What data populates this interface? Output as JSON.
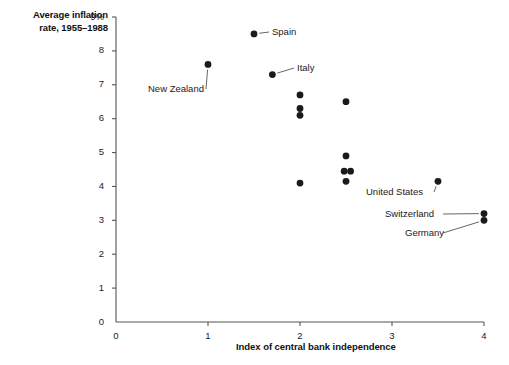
{
  "chart_data": {
    "type": "scatter",
    "title": "",
    "xlabel": "Index of central bank independence",
    "ylabel": "Average inflation rate, 1955–1988",
    "ylabel_lines": [
      "Average inflation",
      "rate, 1955–1988"
    ],
    "xlim": [
      0,
      4
    ],
    "ylim": [
      0,
      9
    ],
    "xticks": [
      0,
      1,
      2,
      3,
      4
    ],
    "xtick_labels": [
      "0",
      "1",
      "2",
      "3",
      "4"
    ],
    "yticks": [
      0,
      1,
      2,
      3,
      4,
      5,
      6,
      7,
      8,
      9
    ],
    "ytick_labels": [
      "0",
      "1",
      "2",
      "3",
      "4",
      "5",
      "6",
      "7",
      "8",
      "9%"
    ],
    "grid": false,
    "legend": null,
    "marker_color": "#1a1a1a",
    "axis_color": "#555555",
    "points": [
      {
        "x": 1.5,
        "y": 8.5,
        "label": "Spain"
      },
      {
        "x": 1.0,
        "y": 7.6,
        "label": "New Zealand"
      },
      {
        "x": 1.7,
        "y": 7.3,
        "label": "Italy"
      },
      {
        "x": 2.0,
        "y": 6.7,
        "label": ""
      },
      {
        "x": 2.0,
        "y": 6.3,
        "label": ""
      },
      {
        "x": 2.0,
        "y": 6.1,
        "label": ""
      },
      {
        "x": 2.5,
        "y": 6.5,
        "label": ""
      },
      {
        "x": 2.5,
        "y": 4.9,
        "label": ""
      },
      {
        "x": 2.48,
        "y": 4.45,
        "label": ""
      },
      {
        "x": 2.55,
        "y": 4.45,
        "label": ""
      },
      {
        "x": 2.5,
        "y": 4.15,
        "label": ""
      },
      {
        "x": 2.0,
        "y": 4.1,
        "label": ""
      },
      {
        "x": 3.5,
        "y": 4.15,
        "label": "United States"
      },
      {
        "x": 4.0,
        "y": 3.2,
        "label": "Switzerland"
      },
      {
        "x": 4.0,
        "y": 3.0,
        "label": "Germany"
      }
    ],
    "annotations": [
      {
        "text": "Spain",
        "x": 1.5,
        "y": 8.5,
        "label_x": 272,
        "label_y": 26
      },
      {
        "text": "New Zealand",
        "x": 1.0,
        "y": 7.6,
        "label_x": 148,
        "label_y": 83
      },
      {
        "text": "Italy",
        "x": 1.7,
        "y": 7.3,
        "label_x": 297,
        "label_y": 62
      },
      {
        "text": "United States",
        "x": 3.5,
        "y": 4.15,
        "label_x": 366,
        "label_y": 186
      },
      {
        "text": "Switzerland",
        "x": 4.0,
        "y": 3.2,
        "label_x": 385,
        "label_y": 208
      },
      {
        "text": "Germany",
        "x": 4.0,
        "y": 3.0,
        "label_x": 405,
        "label_y": 227
      }
    ]
  }
}
